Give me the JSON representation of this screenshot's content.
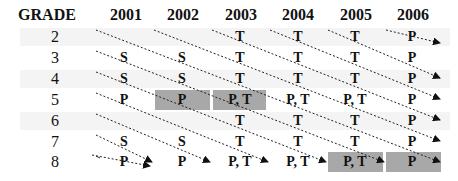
{
  "header": {
    "grade_label": "GRADE",
    "years": [
      "2001",
      "2002",
      "2003",
      "2004",
      "2005",
      "2006"
    ]
  },
  "rows": [
    {
      "grade": "2",
      "cells": [
        "",
        "",
        "T",
        "T",
        "T",
        "P"
      ]
    },
    {
      "grade": "3",
      "cells": [
        "S",
        "S",
        "T",
        "T",
        "T",
        "P"
      ]
    },
    {
      "grade": "4",
      "cells": [
        "S",
        "S",
        "T",
        "T",
        "T",
        "P"
      ]
    },
    {
      "grade": "5",
      "cells": [
        "P",
        "P",
        "P, T",
        "P, T",
        "P, T",
        "P"
      ]
    },
    {
      "grade": "6",
      "cells": [
        "",
        "",
        "T",
        "T",
        "T",
        "P"
      ]
    },
    {
      "grade": "7",
      "cells": [
        "S",
        "S",
        "T",
        "T",
        "T",
        "P"
      ]
    },
    {
      "grade": "8",
      "cells": [
        "P",
        "P",
        "P, T",
        "P, T",
        "P, T",
        "P"
      ]
    }
  ],
  "highlighted_cells": [
    {
      "grade": "5",
      "year": "2002"
    },
    {
      "grade": "5",
      "year": "2003"
    },
    {
      "grade": "8",
      "year": "2005"
    },
    {
      "grade": "8",
      "year": "2006"
    }
  ],
  "colors": {
    "highlight": "#a8a8a8",
    "band": "#f4f4f4",
    "arrow": "#111111"
  },
  "legend_note": "Dashed diagonal arrows trace each student cohort from one grade/year to the next grade/year."
}
